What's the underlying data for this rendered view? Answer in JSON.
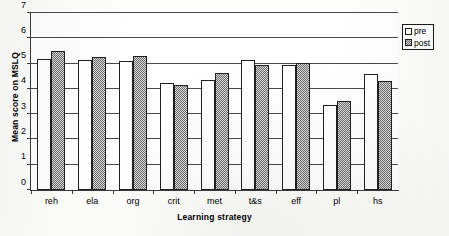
{
  "chart_data": {
    "type": "bar",
    "title": "",
    "subtitle": "",
    "xlabel": "Learning strategy",
    "ylabel": "Mean score on MSLQ",
    "categories": [
      "reh",
      "ela",
      "org",
      "crit",
      "met",
      "t&s",
      "eff",
      "pl",
      "hs"
    ],
    "series": [
      {
        "name": "pre",
        "values": [
          5.2,
          5.15,
          5.12,
          4.22,
          4.37,
          5.14,
          4.95,
          3.37,
          4.57
        ]
      },
      {
        "name": "post",
        "values": [
          5.51,
          5.26,
          5.29,
          4.15,
          4.61,
          4.93,
          5.04,
          3.53,
          4.32
        ]
      }
    ],
    "ylim": [
      0,
      7
    ],
    "yticks": [
      0,
      1,
      2,
      3,
      4,
      5,
      6,
      7
    ],
    "ytick_labels": [
      "0",
      "1",
      "2",
      "3",
      "4",
      "5",
      "6",
      "7"
    ],
    "grid": true,
    "grid_axis": "y",
    "legend_position": "top-right",
    "legend_entries": [
      "pre",
      "post"
    ],
    "colors": {
      "pre": "#ffffff",
      "post": "#9d9d9d",
      "outline": "#202020",
      "axis": "#3a3a3a",
      "grid": "#4a4a4a"
    }
  }
}
